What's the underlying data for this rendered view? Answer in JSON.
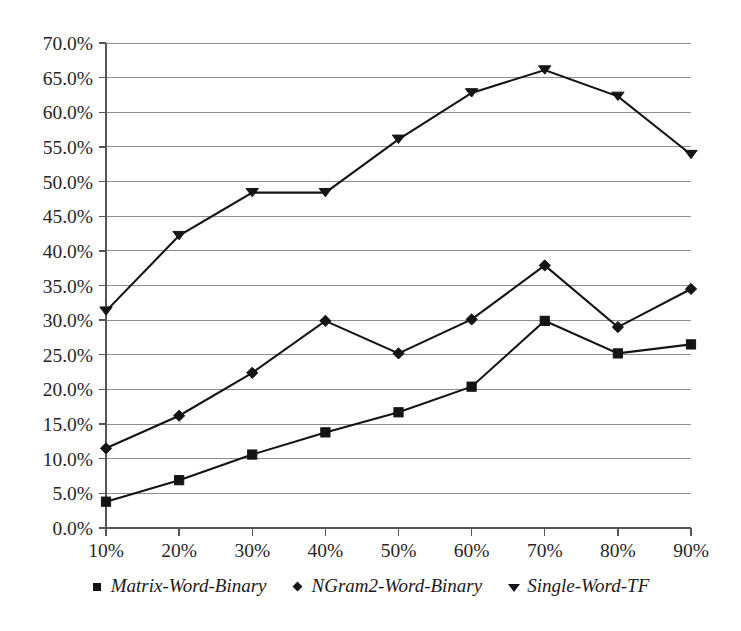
{
  "chart_data": {
    "type": "line",
    "title": "",
    "subtitle": "",
    "xlabel": "",
    "ylabel": "",
    "grid": true,
    "legend_position": "bottom",
    "x": [
      "10%",
      "20%",
      "30%",
      "40%",
      "50%",
      "60%",
      "70%",
      "80%",
      "90%"
    ],
    "xtick_labels": [
      "10%",
      "20%",
      "30%",
      "40%",
      "50%",
      "60%",
      "70%",
      "80%",
      "90%"
    ],
    "ytick_labels": [
      "0.0%",
      "5.0%",
      "10.0%",
      "15.0%",
      "20.0%",
      "25.0%",
      "30.0%",
      "35.0%",
      "40.0%",
      "45.0%",
      "50.0%",
      "55.0%",
      "60.0%",
      "65.0%",
      "70.0%"
    ],
    "ytick_values": [
      0,
      5,
      10,
      15,
      20,
      25,
      30,
      35,
      40,
      45,
      50,
      55,
      60,
      65,
      70
    ],
    "ylim": [
      0,
      70
    ],
    "series": [
      {
        "name": "Matrix-Word-Binary",
        "marker": "square",
        "color": "#141414",
        "values": [
          3.8,
          6.9,
          10.6,
          13.8,
          16.7,
          20.4,
          29.9,
          25.2,
          26.5
        ]
      },
      {
        "name": "NGram2-Word-Binary",
        "marker": "diamond",
        "color": "#141414",
        "values": [
          11.5,
          16.2,
          22.4,
          29.9,
          25.2,
          30.1,
          37.9,
          29.0,
          34.5
        ]
      },
      {
        "name": "Single-Word-TF",
        "marker": "triangle-down",
        "color": "#141414",
        "values": [
          31.3,
          42.2,
          48.4,
          48.4,
          56.1,
          62.8,
          66.1,
          62.3,
          53.9
        ]
      }
    ]
  },
  "legend": {
    "items": [
      {
        "label": "Matrix-Word-Binary",
        "marker": "square"
      },
      {
        "label": "NGram2-Word-Binary",
        "marker": "diamond"
      },
      {
        "label": "Single-Word-TF",
        "marker": "triangle-down"
      }
    ]
  }
}
